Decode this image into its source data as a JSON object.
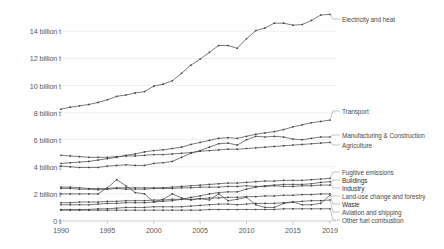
{
  "chart_data": {
    "type": "line",
    "title": "",
    "xlabel": "",
    "ylabel": "",
    "grid": true,
    "legend_position": "right-inline-labels",
    "xlim": [
      1990,
      2019
    ],
    "ylim": [
      0,
      15.5
    ],
    "x": [
      1990,
      1991,
      1992,
      1993,
      1994,
      1995,
      1996,
      1997,
      1998,
      1999,
      2000,
      2001,
      2002,
      2003,
      2004,
      2005,
      2006,
      2007,
      2008,
      2009,
      2010,
      2011,
      2012,
      2013,
      2014,
      2015,
      2016,
      2017,
      2018,
      2019
    ],
    "y_ticks": [
      0,
      2,
      4,
      6,
      8,
      10,
      12,
      14
    ],
    "y_tick_labels": [
      "0 t",
      "2 billion t",
      "4 billion t",
      "6 billion t",
      "8 billion t",
      "10 billion t",
      "12 billion t",
      "14 billion t"
    ],
    "x_ticks": [
      1990,
      1995,
      2000,
      2005,
      2010,
      2015,
      2019
    ],
    "x_tick_labels": [
      "1990",
      "1995",
      "2000",
      "2005",
      "2010",
      "2015",
      "2019"
    ],
    "unit": "billion t",
    "series": [
      {
        "name": "Electricity and heat",
        "label": "Electricity and heat",
        "values": [
          8.25,
          8.4,
          8.5,
          8.6,
          8.75,
          8.95,
          9.2,
          9.3,
          9.45,
          9.55,
          9.95,
          10.1,
          10.35,
          10.9,
          11.5,
          11.95,
          12.45,
          12.95,
          12.95,
          12.75,
          13.45,
          14.05,
          14.25,
          14.6,
          14.6,
          14.45,
          14.5,
          14.8,
          15.2,
          15.25
        ]
      },
      {
        "name": "Transport",
        "label": "Transport",
        "values": [
          4.25,
          4.3,
          4.35,
          4.4,
          4.5,
          4.6,
          4.7,
          4.85,
          4.95,
          5.1,
          5.2,
          5.25,
          5.35,
          5.45,
          5.65,
          5.8,
          5.95,
          6.1,
          6.15,
          6.1,
          6.25,
          6.4,
          6.5,
          6.6,
          6.75,
          6.95,
          7.1,
          7.25,
          7.35,
          7.45
        ]
      },
      {
        "name": "Manufacturing & Construction",
        "label": "Manufacturing & Construction",
        "values": [
          4.05,
          4.0,
          3.95,
          3.95,
          3.95,
          4.05,
          4.1,
          4.15,
          4.1,
          4.1,
          4.25,
          4.3,
          4.4,
          4.7,
          5.0,
          5.2,
          5.45,
          5.7,
          5.75,
          5.6,
          6.0,
          6.25,
          6.2,
          6.25,
          6.2,
          6.05,
          6.0,
          6.1,
          6.2,
          6.2
        ]
      },
      {
        "name": "Agriculture",
        "label": "Agriculture",
        "values": [
          4.85,
          4.8,
          4.75,
          4.7,
          4.7,
          4.7,
          4.75,
          4.8,
          4.8,
          4.85,
          4.9,
          4.9,
          4.95,
          5.0,
          5.05,
          5.15,
          5.2,
          5.25,
          5.3,
          5.3,
          5.35,
          5.4,
          5.45,
          5.5,
          5.55,
          5.6,
          5.65,
          5.7,
          5.75,
          5.8
        ]
      },
      {
        "name": "Fugitive emissions",
        "label": "Fugitive emissions",
        "values": [
          2.5,
          2.5,
          2.45,
          2.4,
          2.4,
          2.4,
          2.45,
          2.45,
          2.45,
          2.45,
          2.45,
          2.45,
          2.5,
          2.55,
          2.6,
          2.65,
          2.7,
          2.75,
          2.8,
          2.8,
          2.85,
          2.9,
          2.95,
          2.95,
          3.0,
          3.0,
          3.0,
          3.05,
          3.1,
          3.15
        ]
      },
      {
        "name": "Buildings",
        "label": "Buildings",
        "values": [
          2.4,
          2.4,
          2.35,
          2.35,
          2.3,
          2.35,
          2.4,
          2.35,
          2.35,
          2.35,
          2.4,
          2.4,
          2.4,
          2.45,
          2.45,
          2.5,
          2.5,
          2.5,
          2.55,
          2.55,
          2.6,
          2.55,
          2.55,
          2.6,
          2.55,
          2.55,
          2.6,
          2.6,
          2.65,
          2.65
        ]
      },
      {
        "name": "Industry",
        "label": "Industry",
        "values": [
          1.2,
          1.2,
          1.2,
          1.2,
          1.25,
          1.3,
          1.3,
          1.35,
          1.35,
          1.35,
          1.4,
          1.45,
          1.5,
          1.6,
          1.75,
          1.85,
          2.0,
          2.1,
          2.15,
          2.15,
          2.35,
          2.5,
          2.6,
          2.65,
          2.7,
          2.7,
          2.7,
          2.75,
          2.85,
          2.9
        ]
      },
      {
        "name": "Land-use change and forestry",
        "label": "Land-use change and forestry",
        "values": [
          2.0,
          2.0,
          2.0,
          2.0,
          2.0,
          2.45,
          3.05,
          2.6,
          2.1,
          2.0,
          1.4,
          1.6,
          2.0,
          1.7,
          1.55,
          1.65,
          1.55,
          2.0,
          1.5,
          1.6,
          1.75,
          1.2,
          1.0,
          1.0,
          1.3,
          1.4,
          1.2,
          1.2,
          1.3,
          1.9
        ]
      },
      {
        "name": "Waste",
        "label": "Waste",
        "values": [
          1.35,
          1.35,
          1.4,
          1.4,
          1.4,
          1.45,
          1.45,
          1.5,
          1.5,
          1.5,
          1.55,
          1.55,
          1.6,
          1.6,
          1.6,
          1.65,
          1.7,
          1.7,
          1.75,
          1.75,
          1.8,
          1.8,
          1.85,
          1.85,
          1.9,
          1.9,
          1.95,
          1.95,
          2.0,
          2.0
        ]
      },
      {
        "name": "Aviation and shipping",
        "label": "Aviation and shipping",
        "values": [
          0.85,
          0.85,
          0.85,
          0.85,
          0.9,
          0.9,
          0.95,
          1.0,
          1.0,
          1.0,
          1.05,
          1.05,
          1.05,
          1.05,
          1.1,
          1.15,
          1.2,
          1.25,
          1.25,
          1.2,
          1.25,
          1.3,
          1.3,
          1.3,
          1.35,
          1.4,
          1.45,
          1.5,
          1.5,
          1.55
        ]
      },
      {
        "name": "Other fuel combustion",
        "label": "Other fuel combustion",
        "values": [
          0.8,
          0.8,
          0.8,
          0.8,
          0.8,
          0.8,
          0.8,
          0.8,
          0.8,
          0.8,
          0.8,
          0.8,
          0.8,
          0.8,
          0.8,
          0.8,
          0.85,
          0.85,
          0.85,
          0.85,
          0.85,
          0.85,
          0.85,
          0.85,
          0.9,
          0.9,
          0.9,
          0.9,
          0.9,
          0.9
        ]
      }
    ],
    "label_positions": [
      {
        "name": "Electricity and heat",
        "y_px": 19,
        "emph": false
      },
      {
        "name": "Transport",
        "y_px": 111,
        "emph": false
      },
      {
        "name": "Manufacturing & Construction",
        "y_px": 135,
        "emph": false
      },
      {
        "name": "Agriculture",
        "y_px": 145,
        "emph": false
      },
      {
        "name": "Fugitive emissions",
        "y_px": 172,
        "emph": false
      },
      {
        "name": "Buildings",
        "y_px": 180,
        "emph": true
      },
      {
        "name": "Industry",
        "y_px": 188,
        "emph": true
      },
      {
        "name": "Land-use change and forestry",
        "y_px": 196,
        "emph": false
      },
      {
        "name": "Waste",
        "y_px": 204,
        "emph": true
      },
      {
        "name": "Aviation and shipping",
        "y_px": 212,
        "emph": false
      },
      {
        "name": "Other fuel combustion",
        "y_px": 220,
        "emph": false
      }
    ]
  }
}
